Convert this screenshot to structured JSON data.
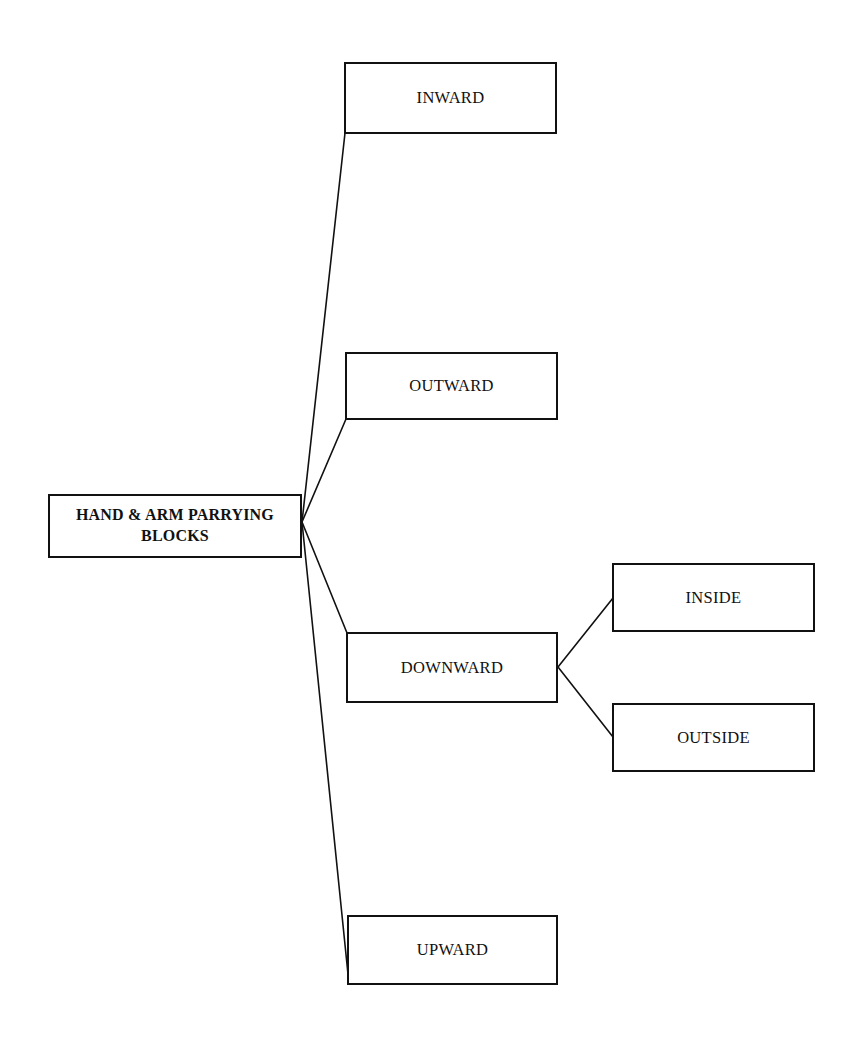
{
  "diagram": {
    "type": "hierarchy-tree",
    "orientation": "left-to-right",
    "background_color": "#ffffff",
    "line_color": "#111111",
    "box_border_color": "#111111",
    "box_fill_color": "#ffffff",
    "root": {
      "id": "root",
      "label": "HAND & ARM PARRYING\nBLOCKS"
    },
    "nodes": [
      {
        "id": "inward",
        "label": "INWARD"
      },
      {
        "id": "outward",
        "label": "OUTWARD"
      },
      {
        "id": "downward",
        "label": "DOWNWARD"
      },
      {
        "id": "upward",
        "label": "UPWARD"
      },
      {
        "id": "inside",
        "label": "INSIDE"
      },
      {
        "id": "outside",
        "label": "OUTSIDE"
      }
    ],
    "edges": [
      {
        "from": "root",
        "to": "inward"
      },
      {
        "from": "root",
        "to": "outward"
      },
      {
        "from": "root",
        "to": "downward"
      },
      {
        "from": "root",
        "to": "upward"
      },
      {
        "from": "downward",
        "to": "inside"
      },
      {
        "from": "downward",
        "to": "outside"
      }
    ]
  }
}
